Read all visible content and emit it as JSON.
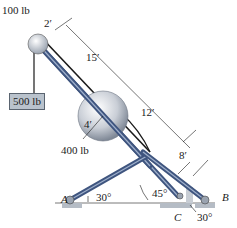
{
  "figure": {
    "labels": {
      "pulley_weight": "100 lb",
      "pulley_diameter": "2′",
      "hanging_weight": "500 lb",
      "dim_15": "15′",
      "dim_12": "12′",
      "dim_8": "8′",
      "ball_radius": "4′",
      "ball_weight": "400 lb",
      "support_a": "A",
      "support_b": "B",
      "support_c": "C",
      "angle_a": "30°",
      "angle_45": "45°",
      "angle_b": "30°"
    },
    "colors": {
      "member": "#3f557f",
      "member_highlight": "#9fb0cc",
      "ground": "#b5bcc5",
      "sphere": "#c9ced6",
      "cable": "#1a1a1a"
    }
  }
}
